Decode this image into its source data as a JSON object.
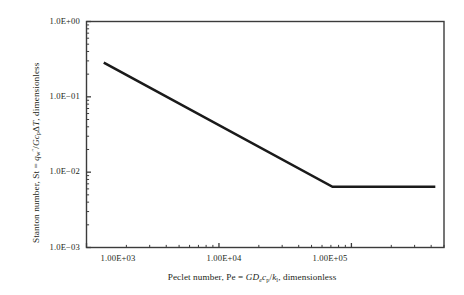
{
  "chart_data": {
    "type": "line",
    "title": "",
    "subtitle": "",
    "xlabel": "Peclet number, Pe = GDecp/kl, dimensionless",
    "ylabel": "Stanton number, St = qw\"/GcpΔT, dimensionless",
    "xscale": "log",
    "yscale": "log",
    "xlim": [
      1000,
      500000
    ],
    "ylim": [
      0.001,
      1.0
    ],
    "grid": false,
    "legend": null,
    "x_tick_labels": [
      "1.00E+03",
      "1.00E+04",
      "1.00E+05"
    ],
    "x_tick_values": [
      1000,
      10000,
      100000
    ],
    "y_tick_labels": [
      "1.0E+00",
      "1.0E−01",
      "1.0E−02",
      "1.0E−03"
    ],
    "y_tick_values": [
      1,
      0.1,
      0.01,
      0.001
    ],
    "series": [
      {
        "name": "Stanton number correlation",
        "x": [
          1350,
          72000,
          430000
        ],
        "y": [
          0.285,
          0.0064,
          0.0064
        ],
        "color": "#1a1a1a",
        "line_width": 2.6
      }
    ],
    "annotations": []
  },
  "labels": {
    "y_axis_title_parts": {
      "lead": "Stanton number, St = ",
      "q": "q",
      "q_sub": "w",
      "q_sup": "″",
      "slash": "/",
      "G": "G",
      "c": "c",
      "c_sub": "p",
      "delta": "Δ",
      "T": "T",
      "tail": ", dimensionless"
    },
    "x_axis_title_parts": {
      "lead": "Peclet number, Pe = ",
      "G": "G",
      "D": "D",
      "D_sub": "e",
      "c": "c",
      "c_sub": "p",
      "slash": "/",
      "k": "k",
      "k_sub": "l",
      "tail": ", dimensionless"
    }
  },
  "colors": {
    "axis": "#3b3b3b",
    "data_line": "#1a1a1a",
    "text": "#231f20",
    "background": "#ffffff"
  }
}
